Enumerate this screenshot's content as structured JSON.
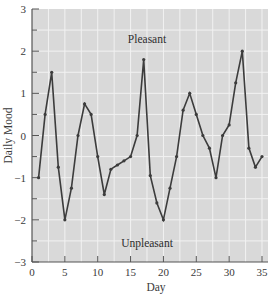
{
  "chart_data": {
    "type": "line",
    "title": "",
    "xlabel": "Day",
    "ylabel": "Daily Mood",
    "xlim": [
      0,
      35
    ],
    "ylim": [
      -3,
      3
    ],
    "xticks": [
      0,
      5,
      10,
      15,
      20,
      25,
      30,
      35
    ],
    "yticks": [
      3,
      2,
      1,
      0,
      -1,
      -2,
      -3
    ],
    "grid": true,
    "annotations": [
      {
        "text": "Pleasant",
        "x": 17.5,
        "y": 2.3
      },
      {
        "text": "Unpleasant",
        "x": 17.5,
        "y": -2.55
      }
    ],
    "series": [
      {
        "name": "Daily Mood",
        "x": [
          1,
          2,
          3,
          4,
          5,
          6,
          7,
          8,
          9,
          10,
          11,
          12,
          13,
          14,
          15,
          16,
          17,
          18,
          19,
          20,
          21,
          22,
          23,
          24,
          25,
          26,
          27,
          28,
          29,
          30,
          31,
          32,
          33,
          34,
          35
        ],
        "values": [
          -1.0,
          0.5,
          1.5,
          -0.75,
          -2.0,
          -1.25,
          0.0,
          0.75,
          0.5,
          -0.5,
          -1.4,
          -0.8,
          -0.7,
          -0.6,
          -0.5,
          0.0,
          1.8,
          -0.95,
          -1.6,
          -2.0,
          -1.25,
          -0.5,
          0.6,
          1.0,
          0.5,
          0.0,
          -0.3,
          -1.0,
          0.0,
          0.25,
          1.25,
          2.0,
          -0.3,
          -0.75,
          -0.5
        ]
      }
    ]
  },
  "colors": {
    "plot_bg": "#d9d9d9",
    "grid": "#f2f2f2",
    "line": "#3c3c3c",
    "axis": "#555555"
  }
}
